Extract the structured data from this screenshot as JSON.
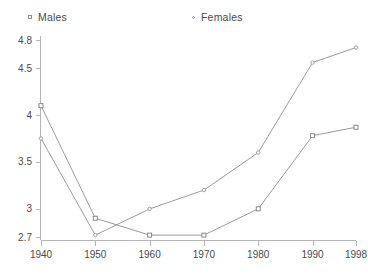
{
  "chart_data": {
    "type": "line",
    "title": "",
    "subtitle": "",
    "xlabel": "",
    "ylabel": "",
    "x": [
      1940,
      1950,
      1960,
      1970,
      1980,
      1990,
      1998
    ],
    "xtick_labels": [
      "1940",
      "1950",
      "1960",
      "1970",
      "1980",
      "1990",
      "1998"
    ],
    "ytick_labels": [
      "2.7",
      "3",
      "3.5",
      "4",
      "4.5",
      "4.8"
    ],
    "yticks": [
      2.7,
      3,
      3.5,
      4,
      4.5,
      4.8
    ],
    "ylim": [
      2.7,
      4.8
    ],
    "xlim": [
      1940,
      1998
    ],
    "grid": false,
    "legend_position": "top",
    "series": [
      {
        "name": "Males",
        "marker": "square",
        "color": "#8e8e8e",
        "values": [
          4.1,
          2.9,
          2.72,
          2.72,
          3.0,
          3.78,
          3.87
        ]
      },
      {
        "name": "Females",
        "marker": "dot",
        "color": "#8e8e8e",
        "values": [
          3.75,
          2.72,
          3.0,
          3.2,
          3.6,
          4.56,
          4.72
        ]
      }
    ]
  },
  "legend": {
    "males_label": "Males",
    "females_label": "Females"
  }
}
